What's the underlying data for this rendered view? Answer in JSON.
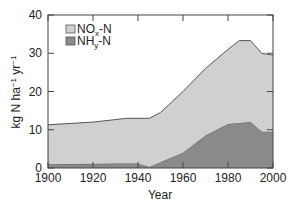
{
  "chart_data": {
    "type": "area",
    "stacked": true,
    "title": "",
    "xlabel": "Year",
    "ylabel": "kg N ha⁻¹ yr⁻¹",
    "xlim": [
      1900,
      2000
    ],
    "ylim": [
      0,
      40
    ],
    "xticks": [
      1900,
      1920,
      1940,
      1960,
      1980,
      2000
    ],
    "yticks": [
      0,
      10,
      20,
      30,
      40
    ],
    "grid": false,
    "legend_position": "upper left",
    "x": [
      1900,
      1920,
      1935,
      1940,
      1945,
      1950,
      1960,
      1970,
      1980,
      1985,
      1990,
      1995,
      2000
    ],
    "series": [
      {
        "name": "NHy-N",
        "color": "#8a8a8a",
        "values": [
          1.0,
          1.1,
          1.2,
          1.2,
          0.3,
          1.5,
          4.0,
          8.5,
          11.5,
          11.8,
          12.0,
          9.5,
          9.5
        ]
      },
      {
        "name": "NOx-N",
        "color": "#d0d0d0",
        "values": [
          10.3,
          10.9,
          11.8,
          11.8,
          12.7,
          13.0,
          16.0,
          17.5,
          19.5,
          21.5,
          21.3,
          20.5,
          20.0
        ]
      }
    ],
    "totals": [
      11.3,
      12.0,
      13.0,
      13.0,
      13.0,
      14.5,
      20.0,
      26.0,
      31.0,
      33.3,
      33.3,
      30.0,
      29.5
    ]
  },
  "legend": {
    "items": [
      {
        "label_main": "NO",
        "label_sub": "x",
        "label_tail": "-N",
        "color": "#d0d0d0"
      },
      {
        "label_main": "NH",
        "label_sub": "y",
        "label_tail": "-N",
        "color": "#8a8a8a"
      }
    ]
  },
  "axes": {
    "x_title": "Year",
    "y_title_main": "kg N ha",
    "y_title_sup1": "−1",
    "y_title_mid": " yr",
    "y_title_sup2": "−1",
    "x_tick_labels": [
      "1900",
      "1920",
      "1940",
      "1960",
      "1980",
      "2000"
    ],
    "y_tick_labels": [
      "0",
      "10",
      "20",
      "30",
      "40"
    ]
  }
}
